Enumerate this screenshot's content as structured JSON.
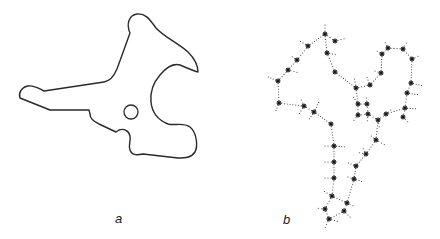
{
  "figure": {
    "panels": [
      {
        "id": "a",
        "label": "a",
        "description": "Closed outline of a 2D shape with a circular hole",
        "stroke_color": "#2a2a2a",
        "outline_path": "M130,33 C126,24 129,15 137,14 C146,13 150,20 156,28 C164,37 178,43 188,52 C195,59 198,66 198,72 C194,71 187,68 180,65 C172,63 166,68 160,75 C153,83 150,92 151,102 C152,112 158,120 168,124 C175,126 183,122 190,127 C197,133 198,146 195,152 C191,158 185,158 178,158 L143,154 C138,155 132,156 130,150 C128,145 131,141 130,136 C129,131 124,128 119,130 L116,132 L99,124 C94,121 90,119 90,114 L89,110 L50,110 L20,98 C18,93 22,87 28,86 C34,85 38,88 44,91 L104,82 C110,81 114,76 117,69 L130,33 Z",
        "hole": {
          "cx": 131,
          "cy": 112,
          "r": 7
        },
        "label_pos": {
          "x": 115,
          "y": 211
        }
      },
      {
        "id": "b",
        "label": "b",
        "description": "Skeleton graph of star-shaped nodes linked by dotted lines",
        "node_color": "#1a1a1a",
        "dot_color": "#333333",
        "nodes": [
          [
            325,
            34
          ],
          [
            335,
            41
          ],
          [
            308,
            46
          ],
          [
            327,
            53
          ],
          [
            297,
            60
          ],
          [
            288,
            70
          ],
          [
            335,
            72
          ],
          [
            278,
            81
          ],
          [
            279,
            103
          ],
          [
            304,
            106
          ],
          [
            314,
            112
          ],
          [
            331,
            124
          ],
          [
            356,
            88
          ],
          [
            370,
            85
          ],
          [
            381,
            73
          ],
          [
            382,
            54
          ],
          [
            388,
            48
          ],
          [
            403,
            49
          ],
          [
            412,
            59
          ],
          [
            411,
            83
          ],
          [
            407,
            93
          ],
          [
            405,
            108
          ],
          [
            403,
            117
          ],
          [
            358,
            104
          ],
          [
            367,
            104
          ],
          [
            358,
            115
          ],
          [
            368,
            114
          ],
          [
            378,
            120
          ],
          [
            386,
            114
          ],
          [
            376,
            140
          ],
          [
            366,
            154
          ],
          [
            356,
            166
          ],
          [
            354,
            179
          ],
          [
            334,
            146
          ],
          [
            334,
            162
          ],
          [
            334,
            178
          ],
          [
            332,
            196
          ],
          [
            347,
            203
          ],
          [
            344,
            211
          ],
          [
            325,
            209
          ],
          [
            329,
            219
          ]
        ],
        "edges": [
          [
            0,
            1
          ],
          [
            0,
            2
          ],
          [
            2,
            4
          ],
          [
            4,
            5
          ],
          [
            5,
            7
          ],
          [
            7,
            8
          ],
          [
            8,
            9
          ],
          [
            9,
            10
          ],
          [
            10,
            11
          ],
          [
            0,
            3
          ],
          [
            3,
            6
          ],
          [
            6,
            12
          ],
          [
            12,
            13
          ],
          [
            13,
            14
          ],
          [
            14,
            15
          ],
          [
            15,
            16
          ],
          [
            16,
            17
          ],
          [
            17,
            18
          ],
          [
            18,
            19
          ],
          [
            19,
            20
          ],
          [
            20,
            21
          ],
          [
            21,
            22
          ],
          [
            12,
            23
          ],
          [
            23,
            24
          ],
          [
            23,
            25
          ],
          [
            24,
            26
          ],
          [
            25,
            26
          ],
          [
            26,
            27
          ],
          [
            27,
            28
          ],
          [
            28,
            21
          ],
          [
            27,
            29
          ],
          [
            29,
            30
          ],
          [
            30,
            31
          ],
          [
            31,
            32
          ],
          [
            32,
            37
          ],
          [
            11,
            33
          ],
          [
            33,
            34
          ],
          [
            34,
            35
          ],
          [
            35,
            36
          ],
          [
            36,
            37
          ],
          [
            37,
            38
          ],
          [
            36,
            39
          ],
          [
            39,
            40
          ],
          [
            38,
            40
          ]
        ],
        "spurs": [
          [
            325,
            34,
            325,
            22
          ],
          [
            335,
            41,
            347,
            38
          ],
          [
            308,
            46,
            298,
            40
          ],
          [
            327,
            53,
            338,
            55
          ],
          [
            297,
            60,
            290,
            55
          ],
          [
            288,
            70,
            300,
            73
          ],
          [
            278,
            81,
            266,
            76
          ],
          [
            279,
            103,
            275,
            113
          ],
          [
            304,
            106,
            300,
            97
          ],
          [
            304,
            106,
            298,
            116
          ],
          [
            314,
            112,
            320,
            100
          ],
          [
            314,
            112,
            308,
            121
          ],
          [
            356,
            88,
            354,
            76
          ],
          [
            370,
            85,
            366,
            75
          ],
          [
            381,
            73,
            372,
            70
          ],
          [
            382,
            54,
            375,
            50
          ],
          [
            388,
            48,
            384,
            40
          ],
          [
            403,
            49,
            408,
            40
          ],
          [
            412,
            59,
            421,
            55
          ],
          [
            411,
            83,
            424,
            86
          ],
          [
            407,
            93,
            420,
            95
          ],
          [
            405,
            108,
            418,
            109
          ],
          [
            403,
            117,
            410,
            124
          ],
          [
            358,
            104,
            352,
            95
          ],
          [
            367,
            104,
            366,
            95
          ],
          [
            358,
            115,
            352,
            123
          ],
          [
            368,
            114,
            367,
            124
          ],
          [
            378,
            120,
            380,
            130
          ],
          [
            386,
            114,
            393,
            108
          ],
          [
            376,
            140,
            387,
            146
          ],
          [
            376,
            140,
            369,
            134
          ],
          [
            366,
            154,
            356,
            152
          ],
          [
            366,
            154,
            362,
            146
          ],
          [
            356,
            166,
            346,
            162
          ],
          [
            354,
            179,
            364,
            182
          ],
          [
            354,
            179,
            345,
            176
          ],
          [
            334,
            146,
            322,
            146
          ],
          [
            334,
            146,
            347,
            147
          ],
          [
            334,
            162,
            322,
            162
          ],
          [
            334,
            178,
            322,
            178
          ],
          [
            332,
            196,
            322,
            190
          ],
          [
            347,
            203,
            356,
            207
          ],
          [
            344,
            211,
            352,
            219
          ],
          [
            325,
            209,
            315,
            208
          ],
          [
            329,
            219,
            324,
            230
          ],
          [
            329,
            219,
            340,
            222
          ]
        ],
        "label_pos": {
          "x": 283,
          "y": 212
        }
      }
    ]
  }
}
